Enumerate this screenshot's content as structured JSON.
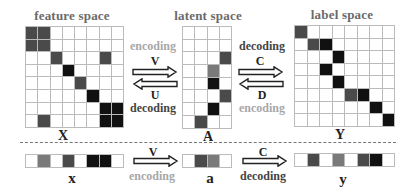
{
  "titles": {
    "feature": "feature space",
    "latent": "latent space",
    "label": "label space"
  },
  "matrix_labels": {
    "X": "X",
    "A": "A",
    "Y": "Y"
  },
  "vector_labels": {
    "x": "x",
    "a": "a",
    "y": "y"
  },
  "operators": {
    "V": "V",
    "U": "U",
    "C": "C",
    "D": "D",
    "encoding": "encoding",
    "decoding": "decoding"
  },
  "colors": {
    "white": "#ffffff",
    "medium": "#7a7a7a",
    "dark": "#4a4a4a",
    "black": "#111111",
    "grid": "#bbbbbb",
    "light_text": "#a8a8a8"
  },
  "matrices": {
    "X": {
      "rows": 8,
      "cols": 8,
      "filled": [
        [
          0,
          0,
          "dark"
        ],
        [
          0,
          1,
          "dark"
        ],
        [
          1,
          0,
          "dark"
        ],
        [
          1,
          1,
          "dark"
        ],
        [
          2,
          2,
          "dark"
        ],
        [
          2,
          6,
          "dark"
        ],
        [
          3,
          3,
          "black"
        ],
        [
          4,
          4,
          "dark"
        ],
        [
          5,
          5,
          "black"
        ],
        [
          6,
          6,
          "black"
        ],
        [
          6,
          7,
          "black"
        ],
        [
          7,
          6,
          "black"
        ],
        [
          7,
          7,
          "black"
        ],
        [
          7,
          1,
          "dark"
        ]
      ]
    },
    "A": {
      "rows": 8,
      "cols": 4,
      "filled": [
        [
          2,
          3,
          "dark"
        ],
        [
          3,
          2,
          "medium"
        ],
        [
          4,
          2,
          "black"
        ],
        [
          5,
          3,
          "dark"
        ],
        [
          6,
          2,
          "black"
        ],
        [
          7,
          1,
          "dark"
        ]
      ]
    },
    "Y": {
      "rows": 8,
      "cols": 8,
      "filled": [
        [
          0,
          0,
          "dark"
        ],
        [
          1,
          1,
          "dark"
        ],
        [
          1,
          2,
          "black"
        ],
        [
          2,
          3,
          "black"
        ],
        [
          3,
          2,
          "black"
        ],
        [
          4,
          3,
          "black"
        ],
        [
          5,
          4,
          "dark"
        ],
        [
          5,
          5,
          "black"
        ],
        [
          6,
          6,
          "black"
        ],
        [
          7,
          7,
          "black"
        ]
      ]
    }
  },
  "vectors": {
    "x": [
      "white",
      "medium",
      "white",
      "dark",
      "white",
      "black",
      "black",
      "white"
    ],
    "a": [
      "white",
      "dark",
      "medium",
      "white"
    ],
    "y": [
      "white",
      "dark",
      "white",
      "medium",
      "white",
      "dark",
      "black",
      "white"
    ]
  }
}
